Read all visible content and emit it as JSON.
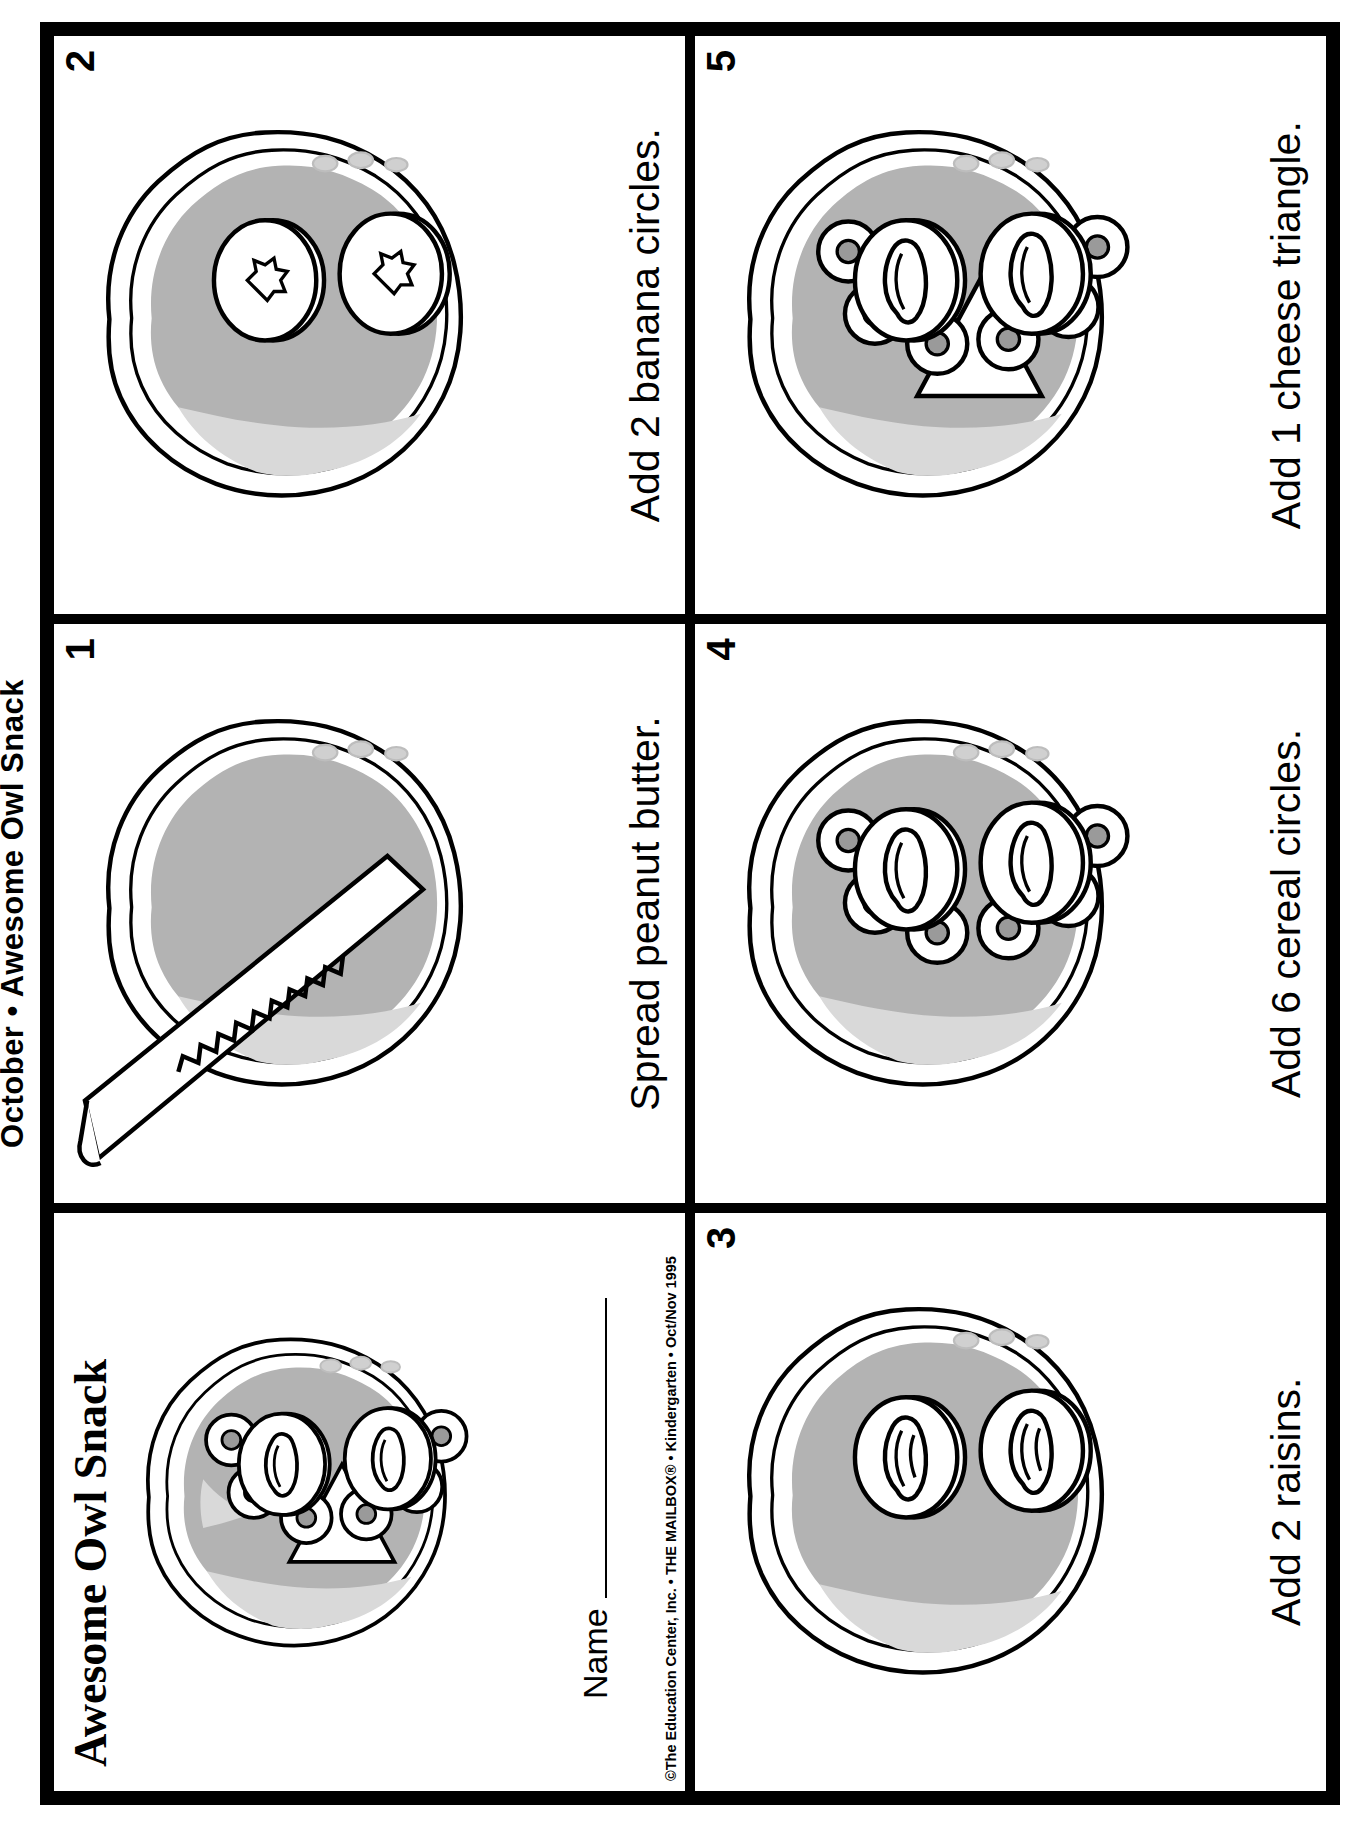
{
  "page": {
    "running_head": "October • Awesome Owl Snack",
    "worksheet_title": "Awesome Owl Snack",
    "name_label": "Name",
    "credit": "©The Education Center, Inc. • THE MAILBOX® • Kindergarten • Oct/Nov 1995"
  },
  "colors": {
    "ink": "#000000",
    "bread_crust": "#ffffff",
    "peanut_butter": "#b3b3b3",
    "peanut_butter_light": "#d9d9d9",
    "raisin_gray": "#999999",
    "cereal_hole": "#8c8c8c"
  },
  "cards": [
    {
      "id": "title",
      "number": "",
      "caption": "",
      "art": "finished-owl-snack"
    },
    {
      "id": "step-1",
      "number": "1",
      "caption": "Spread peanut butter.",
      "art": "bread-with-knife"
    },
    {
      "id": "step-2",
      "number": "2",
      "caption": "Add 2 banana circles.",
      "art": "bread-with-two-banana-circles"
    },
    {
      "id": "step-3",
      "number": "3",
      "caption": "Add 2 raisins.",
      "art": "bread-with-two-raisins"
    },
    {
      "id": "step-4",
      "number": "4",
      "caption": "Add 6 cereal circles.",
      "art": "bread-with-six-cereal-circles"
    },
    {
      "id": "step-5",
      "number": "5",
      "caption": "Add 1 cheese triangle.",
      "art": "bread-with-cheese-triangle"
    }
  ]
}
